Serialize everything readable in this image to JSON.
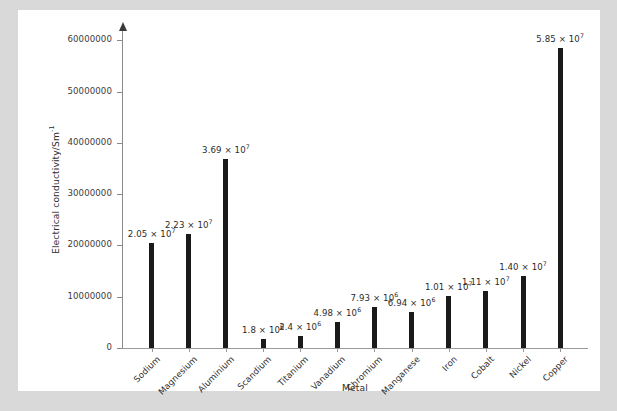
{
  "chart_data": {
    "type": "bar",
    "title": "",
    "xlabel": "Metal",
    "ylabel": "Electrical conductivity/Sm",
    "ylabel_sup": "-1",
    "ylim": [
      0,
      62000000
    ],
    "grid": false,
    "legend": "none",
    "ytick_labels": [
      "0",
      "10000000",
      "20000000",
      "30000000",
      "40000000",
      "50000000",
      "60000000"
    ],
    "ytick_values": [
      0,
      10000000,
      20000000,
      30000000,
      40000000,
      50000000,
      60000000
    ],
    "categories": [
      "Sodium",
      "Magnesium",
      "Aluminium",
      "Scandium",
      "Titanium",
      "Vanadium",
      "Chromium",
      "Manganese",
      "Iron",
      "Cobalt",
      "Nickel",
      "Copper"
    ],
    "values": [
      20500000,
      22300000,
      36900000,
      1800000,
      2400000,
      4980000,
      7930000,
      6940000,
      10100000,
      11100000,
      14000000,
      58500000
    ],
    "value_labels": [
      {
        "mantissa": "2.05 × 10",
        "exponent": "7"
      },
      {
        "mantissa": "2.23 × 10",
        "exponent": "7"
      },
      {
        "mantissa": "3.69 × 10",
        "exponent": "7"
      },
      {
        "mantissa": "1.8 × 10",
        "exponent": "6"
      },
      {
        "mantissa": "2.4 × 10",
        "exponent": "6"
      },
      {
        "mantissa": "4.98 × 10",
        "exponent": "6"
      },
      {
        "mantissa": "7.93 × 10",
        "exponent": "6"
      },
      {
        "mantissa": "6.94 × 10",
        "exponent": "6"
      },
      {
        "mantissa": "1.01 × 10",
        "exponent": "7"
      },
      {
        "mantissa": "1.11 × 10",
        "exponent": "7"
      },
      {
        "mantissa": "1.40 × 10",
        "exponent": "7"
      },
      {
        "mantissa": "5.85 × 10",
        "exponent": "7"
      }
    ],
    "bar_color": "#1a1a1a",
    "axis_color": "#8a8a8a",
    "plot_background": "#ffffff",
    "page_background": "#d9d9d9"
  }
}
